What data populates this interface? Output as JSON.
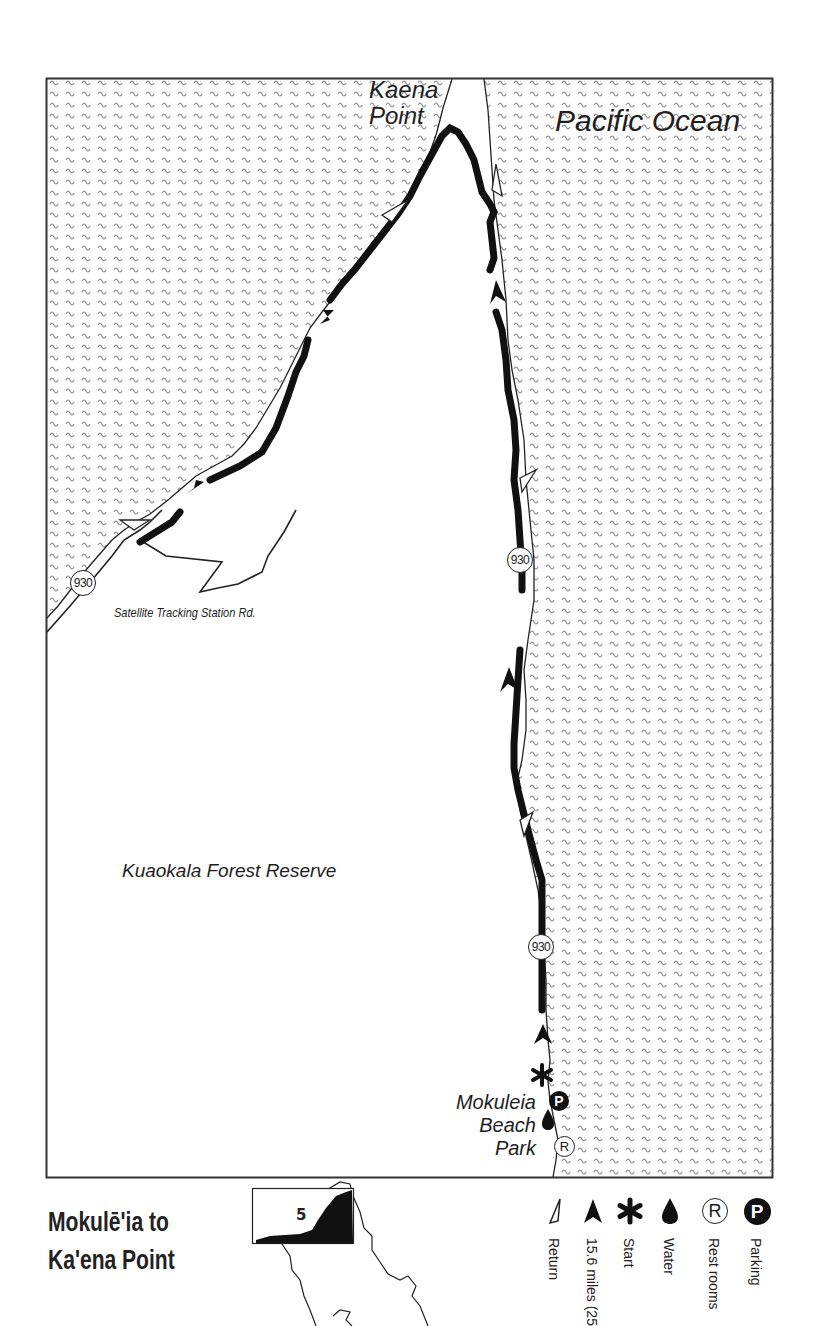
{
  "map": {
    "title_line1": "Mokulē'ia to",
    "title_line2": "Ka'ena Point",
    "labels": {
      "ocean": "Pacific Ocean",
      "point_line1": "Kaena",
      "point_line2": "Point",
      "forest": "Kuaokala Forest Reserve",
      "road": "Satellite Tracking Station Rd.",
      "park_line1": "Mokuleia",
      "park_line2": "Beach",
      "park_line3": "Park"
    },
    "highway_shields": [
      {
        "number": "930",
        "location": "west coast"
      },
      {
        "number": "930",
        "location": "north-east coast upper"
      },
      {
        "number": "930",
        "location": "north-east coast lower"
      }
    ],
    "map_symbols": {
      "parking": "P",
      "restrooms": "R"
    },
    "inset": {
      "section_number": "5"
    },
    "legend": [
      {
        "icon": "return-arrow-icon",
        "label": "Return"
      },
      {
        "icon": "route-arrow-icon",
        "label": "15.6 miles (25"
      },
      {
        "icon": "start-asterisk-icon",
        "label": "Start"
      },
      {
        "icon": "water-drop-icon",
        "label": "Water"
      },
      {
        "icon": "restrooms-icon",
        "symbol": "R",
        "label": "Rest rooms"
      },
      {
        "icon": "parking-icon",
        "symbol": "P",
        "label": "Parking"
      }
    ],
    "colors": {
      "ink": "#111111",
      "wave": "#8a8a8a",
      "paper": "#ffffff"
    }
  }
}
